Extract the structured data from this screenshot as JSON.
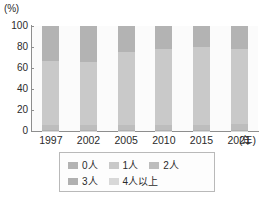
{
  "chart_data": {
    "type": "bar",
    "subtype": "stacked-100-percent",
    "title": "",
    "subtitle": "",
    "xlabel": "年",
    "ylabel": "(%)",
    "ylim": [
      0,
      100
    ],
    "yticks": [
      0,
      20,
      40,
      60,
      80,
      100
    ],
    "ytick_labels": [
      "0",
      "20",
      "40",
      "60",
      "80",
      "100"
    ],
    "grid": false,
    "legend_position": "bottom",
    "categories": [
      "1997",
      "2002",
      "2005",
      "2010",
      "2015",
      "2021"
    ],
    "series": [
      {
        "name": "0人",
        "color": "#b3b3b3",
        "values": [
          33.6,
          34.6,
          25.2,
          21.9,
          20.1,
          22.0
        ]
      },
      {
        "name": "1人",
        "color": "#c9c9c9",
        "values": [
          60.4,
          59.4,
          68.8,
          72.1,
          73.9,
          71.8
        ]
      },
      {
        "name": "2人",
        "color": "#bdbdbd",
        "values": [
          5.0,
          5.0,
          5.0,
          5.0,
          5.0,
          5.2
        ]
      },
      {
        "name": "3人",
        "color": "#b0b0b0",
        "values": [
          0.8,
          0.8,
          0.8,
          0.8,
          0.8,
          0.8
        ]
      },
      {
        "name": "4人以上",
        "color": "#d8d8d8",
        "values": [
          0.2,
          0.2,
          0.2,
          0.2,
          0.2,
          0.2
        ]
      }
    ],
    "stack_order_top_to_bottom": [
      "0人",
      "1人",
      "2人",
      "3人",
      "4人以上"
    ],
    "annotations": []
  },
  "axes": {
    "y_unit": "(%)",
    "x_unit": "(年)",
    "y_tick_labels": [
      "100",
      "80",
      "60",
      "40",
      "20",
      "0"
    ],
    "x_tick_labels": [
      "1997",
      "2002",
      "2005",
      "2010",
      "2015",
      "2021"
    ]
  },
  "legend": {
    "row1": [
      {
        "label": "0人",
        "color": "#b3b3b3"
      },
      {
        "label": "1人",
        "color": "#c9c9c9"
      },
      {
        "label": "2人",
        "color": "#bdbdbd"
      }
    ],
    "row2": [
      {
        "label": "3人",
        "color": "#b0b0b0"
      },
      {
        "label": "4人以上",
        "color": "#d8d8d8"
      }
    ]
  },
  "colors": {
    "axis": "#8e8e8e",
    "text": "#2b2b2b",
    "plot_background": "#fbfbfb",
    "legend_border": "#b9b9b9"
  }
}
